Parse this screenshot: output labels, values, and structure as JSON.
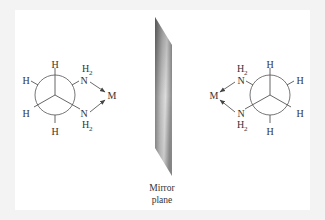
{
  "figure": {
    "background": "#f3f3f3",
    "panel_color": "#ffffff",
    "line_color": "#555555",
    "text_color": "#333333"
  },
  "left_molecule": {
    "projection": "Newman",
    "center": [
      55,
      95
    ],
    "radius": 20,
    "substituents": {
      "front_top": "H",
      "back_upper_left": "H",
      "back_lower_left": "H",
      "front_bottom": "H"
    },
    "amine_top": {
      "atom": "N",
      "hydrogens": "H",
      "subscript": "2"
    },
    "amine_bottom": {
      "atom": "N",
      "hydrogens": "H",
      "subscript": "2"
    },
    "metal": "M"
  },
  "right_molecule": {
    "projection": "Newman",
    "center": [
      270,
      95
    ],
    "radius": 20,
    "substituents": {
      "front_top": "H",
      "back_upper_right": "H",
      "back_lower_right": "H",
      "front_bottom": "H"
    },
    "amine_top": {
      "atom": "N",
      "hydrogens": "H",
      "subscript": "2"
    },
    "amine_bottom": {
      "atom": "N",
      "hydrogens": "H",
      "subscript": "2"
    },
    "metal": "M"
  },
  "mirror": {
    "caption_line1": "Mirror",
    "caption_line2": "plane",
    "gradient_dark": "#7a7a7a",
    "gradient_light": "#e6e6e6"
  }
}
